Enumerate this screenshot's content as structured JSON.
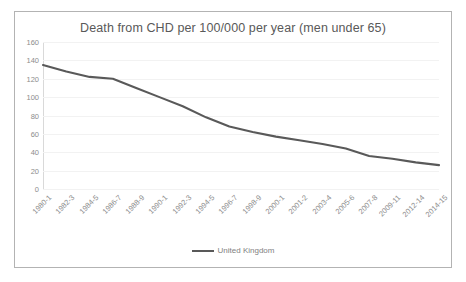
{
  "chart_data": {
    "type": "line",
    "title": "Death from CHD per 100/000 per year (men under 65)",
    "xlabel": "",
    "ylabel": "",
    "ylim": [
      0,
      160
    ],
    "ytick_step": 20,
    "yticks": [
      160,
      140,
      120,
      100,
      80,
      60,
      40,
      20,
      0
    ],
    "grid": true,
    "legend_position": "bottom",
    "categories": [
      "1980-1",
      "1982-3",
      "1984-5",
      "1986-7",
      "1988-9",
      "1990-1",
      "1992-3",
      "1994-5",
      "1996-7",
      "1998-9",
      "2000-1",
      "2001-2",
      "2003-4",
      "2005-6",
      "2007-8",
      "2009-11",
      "2012-14",
      "2014-15"
    ],
    "series": [
      {
        "name": "United Kingdom",
        "color": "#595959",
        "values": [
          135,
          128,
          122,
          120,
          110,
          100,
          90,
          78,
          68,
          62,
          57,
          53,
          49,
          44,
          36,
          33,
          29,
          26
        ]
      }
    ]
  },
  "legend": {
    "marker_name": "line-swatch"
  }
}
